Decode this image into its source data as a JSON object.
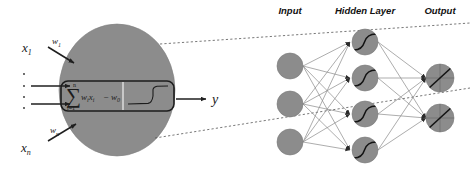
{
  "figure": {
    "background_color": "#ffffff",
    "node_fill": "#8c8c8c",
    "node_stroke": "#6e6e6e",
    "edge_color": "#8a8a8a",
    "ink_color": "#1a1a1a",
    "callout_dash_color": "#555555"
  },
  "neuron_detail": {
    "body_shape": "ellipse",
    "body_fill": "#8c8c8c",
    "box_label": "processing-box",
    "summation": {
      "upper_limit": "n",
      "operator": "∑",
      "lower_limit": "i=1",
      "term": "w",
      "term_sub": "i",
      "term2": "x",
      "term2_sub": "i",
      "minus": "−",
      "bias": "w",
      "bias_sub": "0"
    },
    "activation": {
      "name": "step-function",
      "description": "sharp sigmoid / step transfer curve"
    },
    "inputs": [
      {
        "signal": "x",
        "signal_sub": "1",
        "weight": "w",
        "weight_sub": "1"
      },
      {
        "signal": "x",
        "signal_sub": "n",
        "weight": "w",
        "weight_sub": "n"
      }
    ],
    "ellipsis": "⋮",
    "output": {
      "label": "y"
    }
  },
  "network": {
    "headers": [
      {
        "label": "Input",
        "x": 290
      },
      {
        "label": "Hidden Layer",
        "x": 365
      },
      {
        "label": "Output",
        "x": 440
      }
    ],
    "layers": [
      {
        "name": "input-layer",
        "node_count": 3,
        "glyph": "none",
        "cx": 290,
        "r": 13,
        "cys": [
          66,
          104,
          142
        ]
      },
      {
        "name": "hidden-layer",
        "node_count": 4,
        "glyph": "sigmoid",
        "cx": 365,
        "r": 13,
        "cys": [
          42,
          78,
          114,
          150
        ]
      },
      {
        "name": "output-layer",
        "node_count": 2,
        "glyph": "linear",
        "cx": 440,
        "r": 14,
        "cys": [
          78,
          118
        ]
      }
    ]
  }
}
